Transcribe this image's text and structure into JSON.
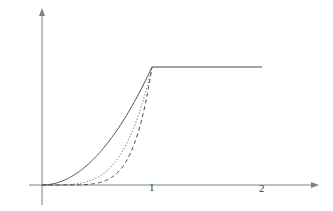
{
  "figure": {
    "background_color": "#ffffff",
    "axis_color": "#808080",
    "curve_color": "#4a4a4a",
    "label_color": "#3c3c3c"
  },
  "axes": {
    "x_axis": {
      "name": "x-axis",
      "has_arrow": true,
      "start_value": -0.12,
      "end_value": 2.48,
      "tick_labels": [
        "1",
        "2"
      ],
      "tick_values": [
        1,
        2
      ]
    },
    "y_axis": {
      "name": "y-axis",
      "has_arrow": true,
      "start_value": -0.17,
      "end_value": 1.55,
      "tick_labels": [],
      "tick_values": []
    }
  },
  "chart_data": {
    "type": "line",
    "title": "",
    "subtitle": "",
    "xlabel": "",
    "ylabel": "",
    "xlim": [
      -0.12,
      2.48
    ],
    "ylim": [
      -0.17,
      1.55
    ],
    "grid": false,
    "legend": null,
    "x_ticks": [
      1,
      2
    ],
    "x_tick_labels": [
      "1",
      "2"
    ],
    "y_ticks": [],
    "y_tick_labels": [],
    "annotations": [],
    "plateau_value": 1,
    "knee_x": 1,
    "series": [
      {
        "name": "curve-solid",
        "style": "solid",
        "exponent": 2,
        "x": [
          0,
          0.1,
          0.2,
          0.3,
          0.4,
          0.5,
          0.6,
          0.7,
          0.8,
          0.9,
          1,
          1.2,
          1.4,
          1.6,
          1.8,
          2
        ],
        "values": [
          0,
          0.01,
          0.04,
          0.09,
          0.16,
          0.25,
          0.36,
          0.49,
          0.64,
          0.81,
          1,
          1,
          1,
          1,
          1,
          1
        ]
      },
      {
        "name": "curve-dotted",
        "style": "dotted",
        "exponent": 4,
        "x": [
          0,
          0.1,
          0.2,
          0.3,
          0.4,
          0.5,
          0.6,
          0.7,
          0.8,
          0.9,
          1
        ],
        "values": [
          0,
          0.0001,
          0.0016,
          0.0081,
          0.0256,
          0.0625,
          0.1296,
          0.2401,
          0.4096,
          0.6561,
          1
        ]
      },
      {
        "name": "curve-dashed",
        "style": "dashed",
        "exponent": 6,
        "x": [
          0,
          0.1,
          0.2,
          0.3,
          0.4,
          0.5,
          0.6,
          0.7,
          0.8,
          0.9,
          1
        ],
        "values": [
          0,
          1e-06,
          6.4e-05,
          0.000729,
          0.004096,
          0.015625,
          0.046656,
          0.117649,
          0.262144,
          0.531441,
          1
        ]
      }
    ]
  }
}
